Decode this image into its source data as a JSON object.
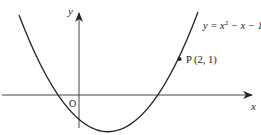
{
  "diagram": {
    "type": "parabola-graph",
    "equation_label": {
      "prefix": "y = x",
      "superscript": "2",
      "suffix": " − x − 1"
    },
    "axes": {
      "x_label": "x",
      "y_label": "y",
      "origin_label": "O"
    },
    "point": {
      "name": "P",
      "label": "P (2, 1)",
      "coords": [
        2,
        1
      ]
    },
    "colors": {
      "curve": "#222222",
      "axes": "#444444",
      "text": "#222222",
      "background": "#ffffff"
    }
  }
}
